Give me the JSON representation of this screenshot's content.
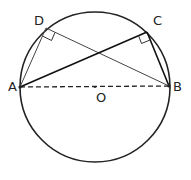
{
  "points": {
    "A": {
      "label": "A"
    },
    "B": {
      "label": "B"
    },
    "C": {
      "label": "C"
    },
    "D": {
      "label": "D"
    },
    "O": {
      "label": "O"
    }
  },
  "elements": {
    "circle": "circle-center-O",
    "diameter": "AB (dashed)",
    "chords": [
      "AD",
      "DB",
      "AC",
      "CB"
    ],
    "right_angles": [
      "ADB",
      "ACB"
    ]
  },
  "colors": {
    "stroke": "#222222",
    "background": "#ffffff"
  }
}
